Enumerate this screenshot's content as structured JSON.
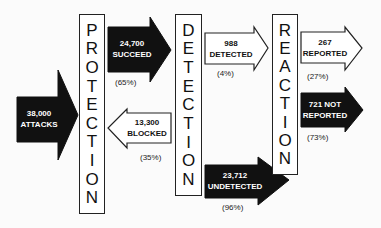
{
  "stages": {
    "protection": {
      "letters": [
        "P",
        "R",
        "O",
        "T",
        "E",
        "C",
        "T",
        "I",
        "O",
        "N"
      ]
    },
    "detection": {
      "letters": [
        "D",
        "E",
        "T",
        "E",
        "C",
        "T",
        "I",
        "O",
        "N"
      ]
    },
    "reaction": {
      "letters": [
        "R",
        "E",
        "A",
        "C",
        "T",
        "I",
        "O",
        "N"
      ]
    }
  },
  "arrows": {
    "attacks": {
      "value": "38,000",
      "label": "ATTACKS",
      "style": "dark"
    },
    "succeed": {
      "value": "24,700",
      "label": "SUCCEED",
      "percent": "(65%)",
      "style": "dark"
    },
    "blocked": {
      "value": "13,300",
      "label": "BLOCKED",
      "percent": "(35%)",
      "style": "light"
    },
    "detected": {
      "value": "988",
      "label": "DETECTED",
      "percent": "(4%)",
      "style": "light"
    },
    "undetected": {
      "value": "23,712",
      "label": "UNDETECTED",
      "percent": "(96%)",
      "style": "dark"
    },
    "reported": {
      "value": "267",
      "label": "REPORTED",
      "percent": "(27%)",
      "style": "light"
    },
    "not_reported": {
      "value": "721 NOT",
      "label": "REPORTED",
      "percent": "(73%)",
      "style": "dark"
    }
  },
  "colors": {
    "dark_fill": "#111111",
    "light_fill": "#ffffff",
    "stroke": "#222222"
  }
}
